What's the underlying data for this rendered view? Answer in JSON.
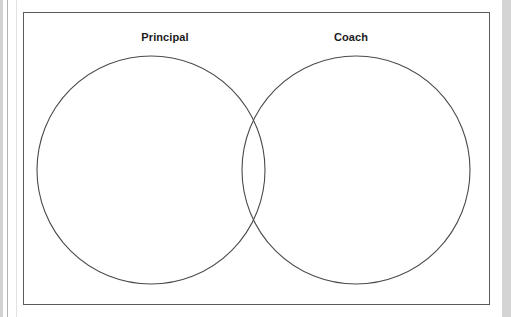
{
  "document": {
    "type": "venn-diagram-worksheet",
    "background_color": "#d9d9d9",
    "page_color": "#ffffff",
    "frame_color": "#5a5a5a"
  },
  "venn": {
    "left_label": "Principal",
    "right_label": "Coach",
    "circle_stroke_color": "#4a4a4a",
    "left_circle": {
      "cx": 151,
      "cy": 170,
      "r": 114
    },
    "right_circle": {
      "cx": 356,
      "cy": 170,
      "r": 114
    }
  },
  "chart_data": {
    "type": "venn",
    "title": "",
    "sets": [
      {
        "name": "Principal",
        "items": [],
        "center": [
          151,
          170
        ],
        "radius": 114
      },
      {
        "name": "Coach",
        "items": [],
        "center": [
          356,
          170
        ],
        "radius": 114
      }
    ],
    "intersection": {
      "label": "",
      "items": []
    },
    "grid": false,
    "legend": "none"
  }
}
